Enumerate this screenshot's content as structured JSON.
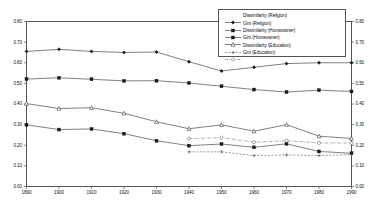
{
  "chart_data": {
    "type": "line",
    "title": "",
    "xlabel": "",
    "ylabel": "",
    "xlim": [
      1890,
      1990
    ],
    "ylim": [
      0.0,
      0.8
    ],
    "grid": false,
    "legend_position": "top-right",
    "x": [
      1890,
      1900,
      1910,
      1920,
      1930,
      1940,
      1950,
      1960,
      1970,
      1980,
      1990
    ],
    "xticklabels": [
      "1890",
      "1900",
      "1910",
      "1920",
      "1930",
      "1940",
      "1950",
      "1960",
      "1970",
      "1980",
      "1990"
    ],
    "yticklabels_left": [
      "0.00",
      "0.10",
      "0.20",
      "0.30",
      "0.40",
      "0.50",
      "0.60",
      "0.70",
      "0.80"
    ],
    "yticklabels_right": [
      "0.00",
      "0.10",
      "0.20",
      "0.30",
      "0.40",
      "0.50",
      "0.60",
      "0.70",
      "0.80"
    ],
    "ytickvalues": [
      0.0,
      0.1,
      0.2,
      0.3,
      0.4,
      0.5,
      0.6,
      0.7,
      0.8
    ],
    "series": [
      {
        "name": "Dissimilarity (Religion)",
        "marker": "filled-diamond",
        "linestyle": "solid",
        "x": [
          1890,
          1900,
          1910,
          1920,
          1930,
          1940,
          1950,
          1960,
          1970,
          1980,
          1990
        ],
        "values": [
          0.655,
          0.665,
          0.655,
          0.65,
          0.652,
          0.605,
          0.56,
          0.578,
          0.596,
          0.6,
          0.6
        ]
      },
      {
        "name": "Gini (Religion)",
        "marker": "filled-square",
        "linestyle": "solid",
        "x": [
          1890,
          1900,
          1910,
          1920,
          1930,
          1940,
          1950,
          1960,
          1970,
          1980,
          1990
        ],
        "values": [
          0.521,
          0.527,
          0.52,
          0.512,
          0.513,
          0.502,
          0.486,
          0.47,
          0.458,
          0.467,
          0.461
        ]
      },
      {
        "name": "Dissimilarity (Homeowner)",
        "marker": "filled-square",
        "linestyle": "solid",
        "x": [
          1890,
          1900,
          1910,
          1920,
          1930,
          1940,
          1950,
          1960,
          1970,
          1980,
          1990
        ],
        "values": [
          0.299,
          0.276,
          0.279,
          0.256,
          0.222,
          0.198,
          0.206,
          0.19,
          0.207,
          0.17,
          0.161
        ]
      },
      {
        "name": "Gini (Homeowner)",
        "marker": "open-triangle",
        "linestyle": "solid",
        "x": [
          1890,
          1900,
          1910,
          1920,
          1930,
          1940,
          1950,
          1960,
          1970,
          1980,
          1990
        ],
        "values": [
          0.402,
          0.378,
          0.382,
          0.355,
          0.314,
          0.28,
          0.299,
          0.268,
          0.3,
          0.244,
          0.233
        ]
      },
      {
        "name": "Dissimilarity (Education)",
        "marker": "plus",
        "linestyle": "dashed",
        "x": [
          1940,
          1950,
          1960,
          1970,
          1980,
          1990
        ],
        "values": [
          0.168,
          0.168,
          0.15,
          0.153,
          0.15,
          0.155
        ]
      },
      {
        "name": "Gini (Education)",
        "marker": "open-circle",
        "linestyle": "dash-dot",
        "x": [
          1940,
          1950,
          1960,
          1970,
          1980,
          1990
        ],
        "values": [
          0.232,
          0.237,
          0.215,
          0.222,
          0.211,
          0.211
        ]
      }
    ]
  },
  "legend": {
    "items": [
      {
        "label": "Dissimilarity (Religion)"
      },
      {
        "label": "Gini (Religion)"
      },
      {
        "label": "Dissimilarity (Homeowner)"
      },
      {
        "label": "Gini (Homeowner)"
      },
      {
        "label": "Dissimilarity (Education)"
      },
      {
        "label": "Gini (Education)"
      }
    ]
  }
}
